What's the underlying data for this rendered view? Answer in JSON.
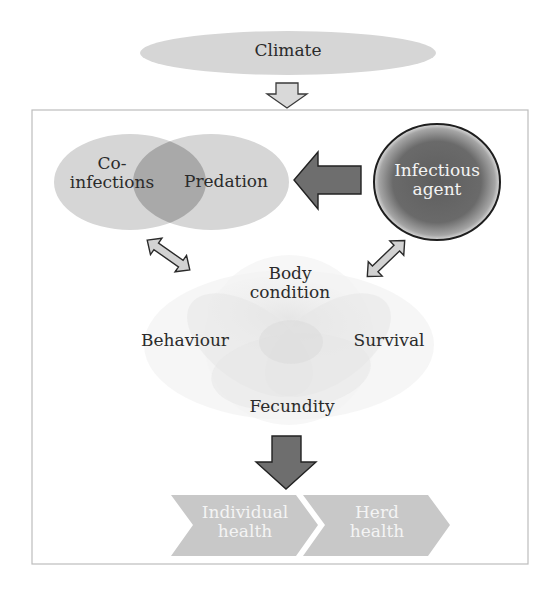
{
  "diagram": {
    "climate": {
      "label": "Climate"
    },
    "left_group": {
      "coinfections": {
        "label_line1": "Co-",
        "label_line2": "infections"
      },
      "predation": {
        "label": "Predation"
      }
    },
    "infectious_agent": {
      "label_line1": "Infectious",
      "label_line2": "agent"
    },
    "center_flower": {
      "body_condition": {
        "label_line1": "Body",
        "label_line2": "condition"
      },
      "behaviour": {
        "label": "Behaviour"
      },
      "survival": {
        "label": "Survival"
      },
      "fecundity": {
        "label": "Fecundity"
      }
    },
    "outcomes": [
      {
        "label_line1": "Individual",
        "label_line2": "health"
      },
      {
        "label_line1": "Herd",
        "label_line2": "health"
      }
    ],
    "colors": {
      "light_fill": "#d6d6d6",
      "overlap_fill": "#a9a9a9",
      "agent_fill": "#6a6a6a",
      "dark_arrow": "#6e6e6e",
      "light_arrow": "#cfcfcf",
      "chevron_fill": "#c8c8c8",
      "box_border": "#bdbdbd"
    }
  }
}
